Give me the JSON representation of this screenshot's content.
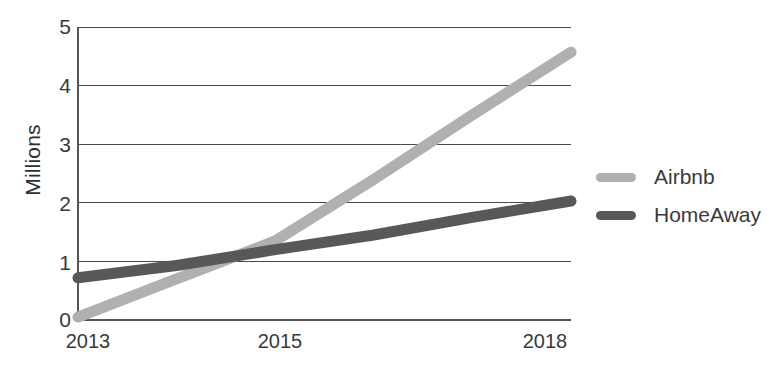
{
  "chart_data": {
    "type": "line",
    "title": "",
    "subtitle": "",
    "xlabel": "",
    "ylabel": "Millions",
    "x": [
      2013,
      2014,
      2015,
      2016,
      2017,
      2018
    ],
    "xlim": [
      2013,
      2018
    ],
    "ylim": [
      0,
      5
    ],
    "grid": true,
    "legend_position": "right",
    "xtick_labels": [
      "2013",
      "2015",
      "2018"
    ],
    "xtick_values": [
      2013,
      2015,
      2018
    ],
    "ytick_labels": [
      "0",
      "1",
      "2",
      "3",
      "4",
      "5"
    ],
    "ytick_values": [
      0,
      1,
      2,
      3,
      4,
      5
    ],
    "series": [
      {
        "name": "Airbnb",
        "color": "#b0b0b0",
        "values": [
          0.05,
          0.7,
          1.35,
          2.4,
          3.5,
          4.57
        ]
      },
      {
        "name": "HomeAway",
        "color": "#585858",
        "values": [
          0.72,
          0.93,
          1.2,
          1.45,
          1.75,
          2.03
        ]
      }
    ]
  },
  "axis": {
    "y_title": "Millions",
    "y_ticks": [
      "5",
      "4",
      "3",
      "2",
      "1",
      "0"
    ],
    "x_ticks": [
      "2013",
      "2015",
      "2018"
    ]
  },
  "legend": {
    "items": [
      {
        "label": "Airbnb",
        "color": "#b0b0b0"
      },
      {
        "label": "HomeAway",
        "color": "#585858"
      }
    ]
  },
  "colors": {
    "airbnb": "#b0b0b0",
    "homeaway": "#585858",
    "axis": "#555555",
    "grid": "#4a4a4a",
    "text": "#3a3a3a",
    "background": "#ffffff"
  }
}
